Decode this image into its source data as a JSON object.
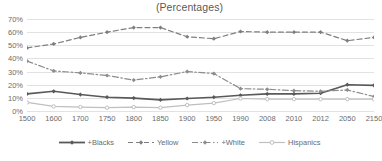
{
  "chart_data": {
    "type": "line",
    "title": "(Percentages)",
    "xlabel": "",
    "ylabel": "",
    "ylim": [
      0,
      70
    ],
    "ytick_step": 10,
    "ytick_suffix": "%",
    "grid": true,
    "legend_position": "bottom",
    "categories": [
      "1500",
      "1600",
      "1700",
      "1750",
      "1800",
      "1850",
      "1900",
      "1950",
      "1990",
      "2008",
      "2010",
      "2012",
      "2050",
      "2150"
    ],
    "yticks": [
      "0%",
      "10%",
      "20%",
      "30%",
      "40%",
      "50%",
      "60%",
      "70%"
    ],
    "series": [
      {
        "name": "+Blacks",
        "color": "#595959",
        "style": "solid",
        "marker": "diamond",
        "values": [
          13,
          15,
          12.5,
          10.5,
          9.8,
          8.5,
          9.5,
          10.5,
          12,
          13,
          13,
          13.5,
          20,
          19.5
        ]
      },
      {
        "name": "Yellow",
        "color": "#7f7f7f",
        "style": "dashed",
        "marker": "diamond",
        "values": [
          48,
          51,
          56,
          60,
          63.5,
          63.5,
          56.5,
          55,
          60.5,
          60,
          60,
          60,
          53.5,
          56
        ]
      },
      {
        "name": "+White",
        "color": "#8c8c8c",
        "style": "dashdot",
        "marker": "diamond",
        "values": [
          38,
          30.5,
          29,
          27,
          23.5,
          26,
          30,
          28.5,
          17,
          16.5,
          15.5,
          15,
          16,
          11
        ]
      },
      {
        "name": "Hispanics",
        "color": "#bfbfbf",
        "style": "solid",
        "marker": "circle",
        "values": [
          6.5,
          3.5,
          3,
          2.5,
          3,
          2.5,
          4.5,
          6,
          9.5,
          9,
          9,
          9,
          9,
          9
        ]
      }
    ]
  }
}
